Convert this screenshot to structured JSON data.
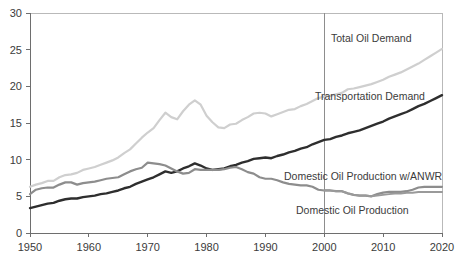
{
  "chart_data": {
    "type": "line",
    "title": "",
    "subtitle": "",
    "xlabel": "",
    "ylabel": "",
    "xlim": [
      1950,
      2020
    ],
    "ylim": [
      0,
      30
    ],
    "grid": false,
    "legend_position": "inline-labels",
    "y_ticks": [
      "0",
      "5",
      "10",
      "15",
      "20",
      "25",
      "30"
    ],
    "y_tick_values": [
      0,
      5,
      10,
      15,
      20,
      25,
      30
    ],
    "x_ticks": [
      "1950",
      "1960",
      "1970",
      "1980",
      "1990",
      "2000",
      "2010",
      "2020"
    ],
    "x_tick_values": [
      1950,
      1960,
      1970,
      1980,
      1990,
      2000,
      2010,
      2020
    ],
    "annotations": [
      {
        "name": "projection-divider",
        "x": 2000,
        "label": ""
      }
    ],
    "series": [
      {
        "name": "Total Oil Demand",
        "label": "Total Oil Demand",
        "color": "#cfcfcf",
        "width": 2.2,
        "label_x": 331,
        "label_y": 42,
        "x": [
          1950,
          1951,
          1952,
          1953,
          1954,
          1955,
          1956,
          1957,
          1958,
          1959,
          1960,
          1961,
          1962,
          1963,
          1964,
          1965,
          1966,
          1967,
          1968,
          1969,
          1970,
          1971,
          1972,
          1973,
          1974,
          1975,
          1976,
          1977,
          1978,
          1979,
          1980,
          1981,
          1982,
          1983,
          1984,
          1985,
          1986,
          1987,
          1988,
          1989,
          1990,
          1991,
          1992,
          1993,
          1994,
          1995,
          1996,
          1997,
          1998,
          1999,
          2000,
          2001,
          2002,
          2003,
          2004,
          2005,
          2006,
          2007,
          2008,
          2009,
          2010,
          2011,
          2012,
          2013,
          2014,
          2015,
          2016,
          2017,
          2018,
          2019,
          2020
        ],
        "values": [
          6.3,
          6.6,
          6.8,
          7.1,
          7.1,
          7.6,
          7.9,
          8.0,
          8.2,
          8.6,
          8.8,
          9.0,
          9.3,
          9.6,
          9.9,
          10.3,
          10.9,
          11.4,
          12.2,
          13.0,
          13.7,
          14.3,
          15.4,
          16.4,
          15.8,
          15.5,
          16.6,
          17.5,
          18.1,
          17.5,
          16.0,
          15.1,
          14.4,
          14.3,
          14.8,
          14.9,
          15.4,
          15.8,
          16.3,
          16.4,
          16.3,
          15.9,
          16.2,
          16.5,
          16.8,
          16.9,
          17.3,
          17.6,
          18.0,
          18.4,
          18.6,
          18.7,
          18.9,
          19.1,
          19.6,
          19.7,
          19.9,
          20.1,
          20.3,
          20.6,
          20.9,
          21.3,
          21.6,
          21.9,
          22.3,
          22.7,
          23.1,
          23.6,
          24.1,
          24.6,
          25.1
        ]
      },
      {
        "name": "Transportation Demand",
        "label": "Transportation Demand",
        "color": "#2e2e2e",
        "width": 2.4,
        "label_x": 315,
        "label_y": 100,
        "x": [
          1950,
          1951,
          1952,
          1953,
          1954,
          1955,
          1956,
          1957,
          1958,
          1959,
          1960,
          1961,
          1962,
          1963,
          1964,
          1965,
          1966,
          1967,
          1968,
          1969,
          1970,
          1971,
          1972,
          1973,
          1974,
          1975,
          1976,
          1977,
          1978,
          1979,
          1980,
          1981,
          1982,
          1983,
          1984,
          1985,
          1986,
          1987,
          1988,
          1989,
          1990,
          1991,
          1992,
          1993,
          1994,
          1995,
          1996,
          1997,
          1998,
          1999,
          2000,
          2001,
          2002,
          2003,
          2004,
          2005,
          2006,
          2007,
          2008,
          2009,
          2010,
          2011,
          2012,
          2013,
          2014,
          2015,
          2016,
          2017,
          2018,
          2019,
          2020
        ],
        "values": [
          3.4,
          3.6,
          3.8,
          4.0,
          4.1,
          4.4,
          4.6,
          4.7,
          4.7,
          4.9,
          5.0,
          5.1,
          5.3,
          5.4,
          5.6,
          5.8,
          6.1,
          6.3,
          6.7,
          7.0,
          7.3,
          7.6,
          8.0,
          8.4,
          8.2,
          8.4,
          8.8,
          9.1,
          9.5,
          9.2,
          8.8,
          8.6,
          8.7,
          8.8,
          9.1,
          9.3,
          9.6,
          9.8,
          10.1,
          10.2,
          10.3,
          10.2,
          10.5,
          10.7,
          11.0,
          11.2,
          11.5,
          11.7,
          12.1,
          12.4,
          12.7,
          12.8,
          13.1,
          13.3,
          13.6,
          13.8,
          14.0,
          14.3,
          14.6,
          14.9,
          15.2,
          15.6,
          15.9,
          16.2,
          16.5,
          16.9,
          17.3,
          17.6,
          18.0,
          18.4,
          18.8
        ]
      },
      {
        "name": "Domestic Oil Production w/ANWR",
        "label": "Domestic Oil Production w/ANWR",
        "color": "#8d8d8d",
        "width": 2.2,
        "label_x": 284,
        "label_y": 180,
        "x": [
          1950,
          1951,
          1952,
          1953,
          1954,
          1955,
          1956,
          1957,
          1958,
          1959,
          1960,
          1961,
          1962,
          1963,
          1964,
          1965,
          1966,
          1967,
          1968,
          1969,
          1970,
          1971,
          1972,
          1973,
          1974,
          1975,
          1976,
          1977,
          1978,
          1979,
          1980,
          1981,
          1982,
          1983,
          1984,
          1985,
          1986,
          1987,
          1988,
          1989,
          1990,
          1991,
          1992,
          1993,
          1994,
          1995,
          1996,
          1997,
          1998,
          1999,
          2000,
          2001,
          2002,
          2003,
          2004,
          2005,
          2006,
          2007,
          2008,
          2009,
          2010,
          2011,
          2012,
          2013,
          2014,
          2015,
          2016,
          2017,
          2018,
          2019,
          2020
        ],
        "values": [
          5.3,
          5.9,
          6.1,
          6.2,
          6.2,
          6.6,
          6.9,
          6.9,
          6.6,
          6.8,
          6.9,
          7.0,
          7.2,
          7.4,
          7.5,
          7.6,
          8.0,
          8.4,
          8.7,
          8.9,
          9.6,
          9.5,
          9.4,
          9.2,
          8.8,
          8.4,
          8.1,
          8.2,
          8.7,
          8.6,
          8.6,
          8.6,
          8.6,
          8.7,
          8.9,
          9.0,
          8.7,
          8.3,
          8.1,
          7.6,
          7.4,
          7.4,
          7.2,
          6.9,
          6.7,
          6.6,
          6.5,
          6.5,
          6.3,
          5.9,
          5.8,
          5.8,
          5.7,
          5.7,
          5.4,
          5.2,
          5.1,
          5.1,
          5.0,
          5.3,
          5.5,
          5.6,
          5.6,
          5.6,
          5.7,
          5.9,
          6.2,
          6.3,
          6.3,
          6.3,
          6.3
        ]
      },
      {
        "name": "Domestic Oil Production",
        "label": "Domestic Oil Production",
        "color": "#9a9a9a",
        "width": 2.0,
        "label_x": 296,
        "label_y": 214,
        "x": [
          2000,
          2001,
          2002,
          2003,
          2004,
          2005,
          2006,
          2007,
          2008,
          2009,
          2010,
          2011,
          2012,
          2013,
          2014,
          2015,
          2016,
          2017,
          2018,
          2019,
          2020
        ],
        "values": [
          5.8,
          5.8,
          5.7,
          5.7,
          5.4,
          5.2,
          5.1,
          5.1,
          5.0,
          5.1,
          5.2,
          5.3,
          5.4,
          5.4,
          5.5,
          5.5,
          5.6,
          5.6,
          5.6,
          5.6,
          5.6
        ]
      }
    ]
  },
  "axes": {
    "plot_left": 30,
    "plot_right": 442,
    "plot_top": 13,
    "plot_bottom": 233
  }
}
